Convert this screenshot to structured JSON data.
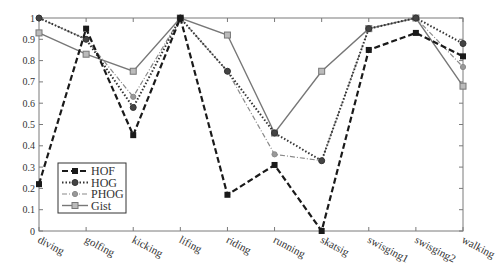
{
  "chart_data": {
    "type": "line",
    "title": "",
    "xlabel": "",
    "ylabel": "",
    "categories": [
      "diving",
      "golfing",
      "kicking",
      "lifing",
      "riding",
      "running",
      "skatsig",
      "swisging1",
      "swisging2",
      "walking"
    ],
    "ylim": [
      0,
      1
    ],
    "yticks": [
      "0",
      "0.1",
      "0.2",
      "0.3",
      "0.4",
      "0.5",
      "0.6",
      "0.7",
      "0.8",
      "0.9",
      "1"
    ],
    "grid": false,
    "legend_position": "lower-left inside",
    "series": [
      {
        "name": "HOF",
        "style": "dashed",
        "marker": "square-filled",
        "color": "#1a1a1a",
        "values": [
          0.22,
          0.95,
          0.45,
          1.0,
          0.17,
          0.31,
          0.0,
          0.85,
          0.93,
          0.82
        ]
      },
      {
        "name": "HOG",
        "style": "dotted",
        "marker": "circle-filled",
        "color": "#333333",
        "values": [
          1.0,
          0.9,
          0.58,
          1.0,
          0.75,
          0.46,
          0.33,
          0.95,
          1.0,
          0.88
        ]
      },
      {
        "name": "PHOG",
        "style": "dashdot",
        "marker": "circle-small",
        "color": "#8a8a8a",
        "values": [
          1.0,
          0.9,
          0.63,
          1.0,
          0.75,
          0.36,
          0.33,
          0.95,
          1.0,
          0.77
        ]
      },
      {
        "name": "Gist",
        "style": "solid",
        "marker": "square-open",
        "color": "#777777",
        "values": [
          0.93,
          0.83,
          0.75,
          1.0,
          0.92,
          0.46,
          0.75,
          0.95,
          1.0,
          0.68
        ]
      }
    ]
  }
}
